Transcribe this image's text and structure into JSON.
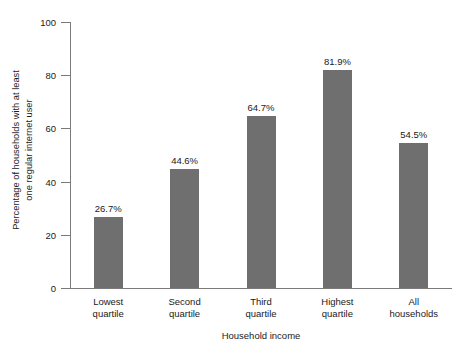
{
  "chart_data": {
    "type": "bar",
    "title": "",
    "subtitle": "",
    "xlabel": "Household income",
    "ylabel": "Percentage of households with at least one regular internet user",
    "ylabel_line1": "Percentage of households with at least",
    "ylabel_line2": "one regular internet user",
    "categories": [
      "Lowest quartile",
      "Second quartile",
      "Third quartile",
      "Highest quartile",
      "All households"
    ],
    "category_lines": [
      [
        "Lowest",
        "quartile"
      ],
      [
        "Second",
        "quartile"
      ],
      [
        "Third",
        "quartile"
      ],
      [
        "Highest",
        "quartile"
      ],
      [
        "All",
        "households"
      ]
    ],
    "values": [
      26.7,
      44.6,
      64.7,
      81.9,
      54.5
    ],
    "value_labels": [
      "26.7%",
      "44.6%",
      "64.7%",
      "81.9%",
      "54.5%"
    ],
    "ylim": [
      0,
      100
    ],
    "yticks": [
      0,
      20,
      40,
      60,
      80,
      100
    ],
    "ytick_labels": [
      "0",
      "20",
      "40",
      "60",
      "80",
      "100"
    ],
    "grid": false,
    "legend": null,
    "legend_position": "none",
    "bar_color": "#6f6f6f",
    "axis_color": "#7a7a7a",
    "text_color": "#1a1a1a",
    "background_color": "#ffffff"
  }
}
